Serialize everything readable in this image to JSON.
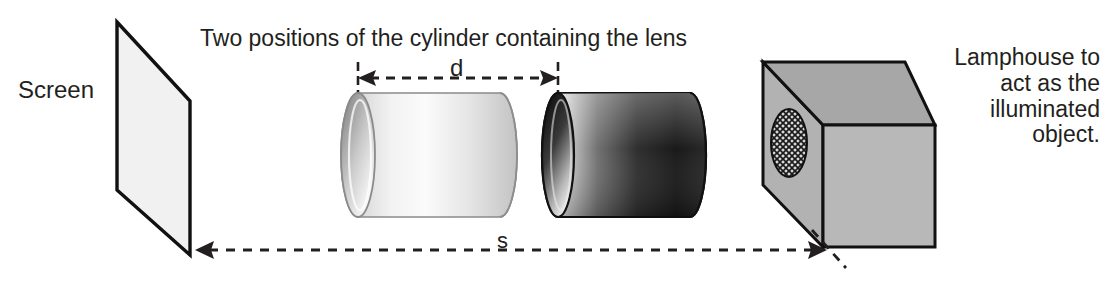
{
  "figure": {
    "type": "optics-apparatus-diagram",
    "background_color": "#ffffff",
    "ink_color": "#231f20"
  },
  "labels": {
    "screen": "Screen",
    "title": "Two positions of the cylinder containing the lens",
    "lamphouse": "Lamphouse to act as the illuminated object.",
    "lamphouse_lines": [
      "Lamphouse to",
      "act as the",
      "illuminated",
      "object."
    ]
  },
  "dimensions": {
    "d": {
      "symbol": "d",
      "description": "separation between the two cylinder positions",
      "style": "dashed double-headed arrow",
      "x_start": 358,
      "x_end": 558,
      "y": 78
    },
    "s": {
      "symbol": "s",
      "description": "distance from screen to illuminated object",
      "style": "dashed double-headed arrow",
      "x_start": 197,
      "x_end": 823,
      "y": 250
    }
  },
  "objects": {
    "screen": {
      "name": "Screen",
      "shape": "parallelogram",
      "fill": "#f1f1f1",
      "stroke": "#000000",
      "points": "117,22 190,101 190,255 117,190"
    },
    "cylinder_light": {
      "name": "cylinder containing the lens (position 1)",
      "shade": "light",
      "body_fill_from": "#ffffff",
      "body_fill_to": "#b9b9b9",
      "face_fill_from": "#9a9a9a",
      "face_fill_to": "#ffffff",
      "cx_left": 358,
      "cx_right": 500,
      "cy": 155,
      "ry": 62,
      "rx": 17
    },
    "cylinder_dark": {
      "name": "cylinder containing the lens (position 2)",
      "shade": "dark",
      "body_fill_from": "#e8e8e8",
      "body_fill_to": "#1a1a1a",
      "face_fill_from": "#111111",
      "face_fill_to": "#f7f7f7",
      "cx_left": 558,
      "cx_right": 690,
      "cy": 155,
      "ry": 62,
      "rx": 16
    },
    "lamphouse": {
      "name": "Lamphouse",
      "fill_front": "#b0b0b0",
      "fill_top": "#a2a2a2",
      "fill_side": "#9a9a9a",
      "stroke": "#000000",
      "aperture": {
        "name": "illuminated object grid aperture",
        "pattern": "cross-hatch",
        "cx": 789,
        "cy": 142,
        "rx": 18,
        "ry": 34
      }
    }
  }
}
